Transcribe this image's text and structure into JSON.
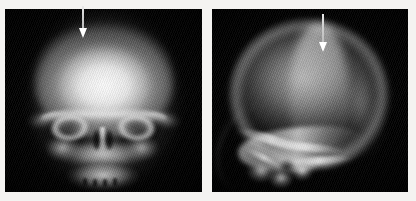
{
  "figure": {
    "modality": "radiograph",
    "description": "Paired skull radiographs with arrow annotations",
    "background_color": "#f4f3f1",
    "panel_background_color": "#000000",
    "annotation_color": "#ffffff",
    "panel_count": 2
  },
  "panels": [
    {
      "id": "panel-ap",
      "view_label": "AP skull radiograph",
      "position": "left",
      "anatomy": [
        "cranial vault",
        "frontal bone",
        "orbital rims",
        "nasal cavity",
        "nasal septum",
        "maxilla",
        "zygomatic arches",
        "mandible",
        "dental arch"
      ],
      "annotation": {
        "name": "arrow-marker",
        "shape": "down-arrow",
        "color": "#ffffff",
        "points_to": "right frontal calvarial lesion"
      }
    },
    {
      "id": "panel-lat",
      "view_label": "Lateral skull radiograph",
      "position": "right",
      "anatomy": [
        "cranial vault",
        "frontal bone",
        "parietal bone",
        "occipital bone",
        "skull base",
        "petrous ridge",
        "mastoid",
        "facial bones"
      ],
      "annotation": {
        "name": "arrow-marker",
        "shape": "down-arrow",
        "color": "#ffffff",
        "points_to": "frontoparietal calvarial lesion"
      }
    }
  ]
}
